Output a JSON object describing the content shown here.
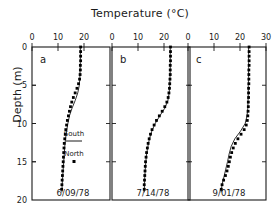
{
  "chart_data": {
    "type": "line",
    "title": "Temperature (°C)",
    "xlabel": "Temperature (°C)",
    "ylabel": "Depth (m)",
    "grid": false,
    "y_axis": {
      "label": "Depth (m)",
      "ticks": [
        0,
        5,
        10,
        15,
        20
      ],
      "ylim": [
        0,
        20
      ],
      "inverted": true
    },
    "legend": {
      "position": "panel-a-inset",
      "entries": [
        {
          "name": "South",
          "style": "solid-line"
        },
        {
          "name": "North",
          "style": "dotted-markers"
        }
      ]
    },
    "panels": [
      {
        "id": "a",
        "label": "a",
        "date": "6/09/78",
        "xlim": [
          0,
          30
        ],
        "xticks": [
          0,
          10,
          20
        ],
        "series": [
          {
            "name": "South",
            "style": "line",
            "points": [
              [
                18.6,
                0
              ],
              [
                18.6,
                1
              ],
              [
                18.6,
                2
              ],
              [
                18.5,
                3
              ],
              [
                18.4,
                4
              ],
              [
                18.2,
                5
              ],
              [
                17.6,
                6
              ],
              [
                16.6,
                7
              ],
              [
                15.4,
                8
              ],
              [
                14.4,
                9
              ],
              [
                13.8,
                10
              ],
              [
                13.3,
                11
              ],
              [
                12.9,
                12
              ],
              [
                12.6,
                13
              ],
              [
                12.4,
                14
              ],
              [
                12.2,
                15
              ],
              [
                12.0,
                16
              ],
              [
                11.8,
                17
              ],
              [
                11.6,
                18
              ],
              [
                11.5,
                19
              ]
            ]
          },
          {
            "name": "North",
            "style": "dots",
            "points": [
              [
                18.7,
                0
              ],
              [
                18.7,
                0.6
              ],
              [
                18.7,
                1.2
              ],
              [
                18.7,
                1.8
              ],
              [
                18.6,
                2.4
              ],
              [
                18.6,
                3.0
              ],
              [
                18.5,
                3.6
              ],
              [
                18.3,
                4.2
              ],
              [
                17.9,
                4.8
              ],
              [
                17.3,
                5.4
              ],
              [
                16.6,
                6.0
              ],
              [
                15.9,
                6.6
              ],
              [
                15.3,
                7.2
              ],
              [
                14.8,
                7.8
              ],
              [
                14.4,
                8.4
              ],
              [
                14.0,
                9.0
              ],
              [
                13.6,
                9.6
              ],
              [
                13.3,
                10.2
              ],
              [
                13.0,
                10.8
              ],
              [
                12.8,
                11.4
              ],
              [
                12.6,
                12.0
              ],
              [
                12.4,
                12.6
              ],
              [
                12.3,
                13.2
              ],
              [
                12.2,
                13.8
              ],
              [
                12.1,
                14.4
              ],
              [
                12.0,
                15.0
              ],
              [
                11.9,
                15.6
              ],
              [
                11.8,
                16.2
              ],
              [
                11.7,
                16.8
              ],
              [
                11.6,
                17.4
              ],
              [
                11.5,
                18.0
              ],
              [
                11.4,
                18.6
              ]
            ]
          }
        ]
      },
      {
        "id": "b",
        "label": "b",
        "date": "7/14/78",
        "xlim": [
          0,
          30
        ],
        "xticks": [
          0,
          10,
          20
        ],
        "series": [
          {
            "name": "South",
            "style": "line",
            "points": [
              [
                22.4,
                0
              ],
              [
                22.4,
                1
              ],
              [
                22.4,
                2
              ],
              [
                22.4,
                3
              ],
              [
                22.3,
                4
              ],
              [
                22.2,
                5
              ],
              [
                22.0,
                6
              ],
              [
                21.5,
                7
              ],
              [
                20.3,
                8
              ],
              [
                18.4,
                9
              ],
              [
                16.6,
                10
              ],
              [
                15.3,
                11
              ],
              [
                14.4,
                12
              ],
              [
                13.8,
                13
              ],
              [
                13.3,
                14
              ],
              [
                13.0,
                15
              ],
              [
                12.8,
                16
              ],
              [
                12.6,
                17
              ],
              [
                12.5,
                18
              ],
              [
                12.4,
                19
              ]
            ]
          },
          {
            "name": "North",
            "style": "dots",
            "points": [
              [
                22.5,
                0
              ],
              [
                22.5,
                0.6
              ],
              [
                22.5,
                1.2
              ],
              [
                22.5,
                1.8
              ],
              [
                22.4,
                2.4
              ],
              [
                22.4,
                3.0
              ],
              [
                22.4,
                3.6
              ],
              [
                22.3,
                4.2
              ],
              [
                22.2,
                4.8
              ],
              [
                22.1,
                5.4
              ],
              [
                21.9,
                6.0
              ],
              [
                21.6,
                6.6
              ],
              [
                21.1,
                7.2
              ],
              [
                20.3,
                7.8
              ],
              [
                19.3,
                8.4
              ],
              [
                18.2,
                9.0
              ],
              [
                17.1,
                9.6
              ],
              [
                16.2,
                10.2
              ],
              [
                15.4,
                10.8
              ],
              [
                14.8,
                11.4
              ],
              [
                14.3,
                12.0
              ],
              [
                13.9,
                12.6
              ],
              [
                13.6,
                13.2
              ],
              [
                13.3,
                13.8
              ],
              [
                13.1,
                14.4
              ],
              [
                12.9,
                15.0
              ],
              [
                12.8,
                15.6
              ],
              [
                12.7,
                16.2
              ],
              [
                12.6,
                16.8
              ],
              [
                12.5,
                17.4
              ],
              [
                12.4,
                18.0
              ],
              [
                12.4,
                18.6
              ]
            ]
          }
        ]
      },
      {
        "id": "c",
        "label": "c",
        "date": "9/01/78",
        "xlim": [
          0,
          30
        ],
        "xticks": [
          0,
          10,
          20,
          30
        ],
        "series": [
          {
            "name": "South",
            "style": "line",
            "points": [
              [
                23.3,
                0
              ],
              [
                23.3,
                1
              ],
              [
                23.3,
                2
              ],
              [
                23.3,
                3
              ],
              [
                23.3,
                4
              ],
              [
                23.2,
                5
              ],
              [
                23.2,
                6
              ],
              [
                23.1,
                7
              ],
              [
                23.0,
                8
              ],
              [
                22.7,
                9
              ],
              [
                22.0,
                10
              ],
              [
                20.2,
                11
              ],
              [
                18.0,
                12
              ],
              [
                16.6,
                13
              ],
              [
                15.8,
                14
              ],
              [
                15.2,
                15
              ],
              [
                14.5,
                16
              ],
              [
                13.8,
                17
              ],
              [
                13.1,
                18
              ],
              [
                12.7,
                19
              ]
            ]
          },
          {
            "name": "North",
            "style": "dots",
            "points": [
              [
                23.5,
                0
              ],
              [
                23.5,
                0.6
              ],
              [
                23.5,
                1.2
              ],
              [
                23.5,
                1.8
              ],
              [
                23.5,
                2.4
              ],
              [
                23.4,
                3.0
              ],
              [
                23.4,
                3.6
              ],
              [
                23.4,
                4.2
              ],
              [
                23.4,
                4.8
              ],
              [
                23.3,
                5.4
              ],
              [
                23.3,
                6.0
              ],
              [
                23.3,
                6.6
              ],
              [
                23.2,
                7.2
              ],
              [
                23.2,
                7.8
              ],
              [
                23.1,
                8.4
              ],
              [
                23.0,
                9.0
              ],
              [
                22.8,
                9.6
              ],
              [
                22.4,
                10.2
              ],
              [
                21.6,
                10.8
              ],
              [
                20.4,
                11.4
              ],
              [
                19.2,
                12.0
              ],
              [
                18.2,
                12.6
              ],
              [
                17.4,
                13.2
              ],
              [
                16.8,
                13.8
              ],
              [
                16.3,
                14.4
              ],
              [
                15.9,
                15.0
              ],
              [
                15.5,
                15.6
              ],
              [
                15.0,
                16.2
              ],
              [
                14.4,
                16.8
              ],
              [
                13.7,
                17.4
              ],
              [
                13.1,
                18.0
              ],
              [
                12.8,
                18.6
              ]
            ]
          }
        ]
      }
    ]
  }
}
